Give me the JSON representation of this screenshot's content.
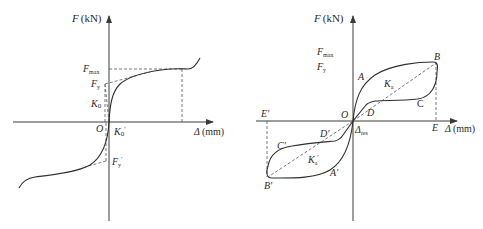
{
  "left_diagram": {
    "y_axis_label": {
      "var": "F",
      "unit": "(kN)"
    },
    "x_axis_label": {
      "var": "Δ",
      "unit": "(mm)"
    },
    "origin": "O",
    "labels": {
      "fmax": {
        "main": "F",
        "sub": "max"
      },
      "fy": {
        "main": "F",
        "sub": "y"
      },
      "k0": {
        "main": "K",
        "sub": "0"
      },
      "k0_prime": {
        "main": "K",
        "sub": "0",
        "prime": "′"
      },
      "fy_prime": {
        "main": "F",
        "sub": "y",
        "prime": "′"
      }
    }
  },
  "right_diagram": {
    "y_axis_label": {
      "var": "F",
      "unit": "(kN)"
    },
    "x_axis_label": {
      "var": "Δ",
      "unit": "(mm)"
    },
    "origin": "O",
    "labels": {
      "fmax": {
        "main": "F",
        "sub": "max"
      },
      "fy": {
        "main": "F",
        "sub": "y"
      },
      "A": "A",
      "B": "B",
      "C": "C",
      "D": "D",
      "E": "E",
      "ka": {
        "main": "K",
        "sub": "a"
      },
      "A_prime": "A′",
      "B_prime": "B′",
      "C_prime": "C′",
      "D_prime": "D′",
      "E_prime": "E′",
      "ka_prime": {
        "main": "K",
        "sub": "a",
        "prime": "′"
      },
      "delta_res": {
        "main": "Δ",
        "sub": "res"
      }
    }
  },
  "colors": {
    "line": "#2e2e2e",
    "dash": "#555555",
    "background": "#ffffff"
  }
}
